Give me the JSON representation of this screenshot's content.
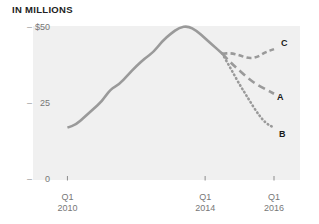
{
  "chart_data": {
    "type": "line",
    "title": "IN MILLIONS",
    "xlabel": "",
    "ylabel": "",
    "ylim": [
      0,
      50
    ],
    "yticks": [
      0,
      25,
      50
    ],
    "ytick_labels": [
      "0",
      "25",
      "$50"
    ],
    "xtick_labels": [
      {
        "quarter": "Q1",
        "year": "2010"
      },
      {
        "quarter": "Q1",
        "year": "2014"
      },
      {
        "quarter": "Q1",
        "year": "2016"
      }
    ],
    "xlim": [
      "Q1 2009",
      "Q1 2016"
    ],
    "grid": false,
    "legend_position": "inline-right",
    "line_color": "#9a9a9a",
    "series": [
      {
        "name": "historical",
        "label": "",
        "style": "solid",
        "points": [
          {
            "x": "Q1 2010",
            "y": 17.0
          },
          {
            "x": "Q2 2010",
            "y": 18.0
          },
          {
            "x": "Q3 2010",
            "y": 20.5
          },
          {
            "x": "Q4 2010",
            "y": 23.0
          },
          {
            "x": "Q1 2011",
            "y": 25.5
          },
          {
            "x": "Q2 2011",
            "y": 29.5
          },
          {
            "x": "Q3 2011",
            "y": 31.0
          },
          {
            "x": "Q4 2011",
            "y": 34.0
          },
          {
            "x": "Q1 2012",
            "y": 37.0
          },
          {
            "x": "Q2 2012",
            "y": 39.5
          },
          {
            "x": "Q3 2012",
            "y": 41.5
          },
          {
            "x": "Q4 2012",
            "y": 45.0
          },
          {
            "x": "Q1 2013",
            "y": 47.5
          },
          {
            "x": "Q2 2013",
            "y": 49.5
          },
          {
            "x": "Q3 2013",
            "y": 50.0
          },
          {
            "x": "Q4 2013",
            "y": 48.5
          },
          {
            "x": "Q1 2014",
            "y": 46.0
          },
          {
            "x": "Q2 2014",
            "y": 43.5
          },
          {
            "x": "Q3 2014",
            "y": 41.0
          }
        ]
      },
      {
        "name": "scenario-c",
        "label": "C",
        "style": "dashed",
        "points": [
          {
            "x": "Q3 2014",
            "y": 41.0
          },
          {
            "x": "Q4 2014",
            "y": 41.2
          },
          {
            "x": "Q1 2015",
            "y": 40.5
          },
          {
            "x": "Q2 2015",
            "y": 39.5
          },
          {
            "x": "Q3 2015",
            "y": 39.8
          },
          {
            "x": "Q4 2015",
            "y": 41.5
          },
          {
            "x": "Q1 2016",
            "y": 42.5
          }
        ]
      },
      {
        "name": "scenario-a",
        "label": "A",
        "style": "long-dash",
        "points": [
          {
            "x": "Q3 2014",
            "y": 41.0
          },
          {
            "x": "Q4 2014",
            "y": 38.0
          },
          {
            "x": "Q1 2015",
            "y": 35.5
          },
          {
            "x": "Q2 2015",
            "y": 33.0
          },
          {
            "x": "Q3 2015",
            "y": 31.0
          },
          {
            "x": "Q4 2015",
            "y": 29.5
          },
          {
            "x": "Q1 2016",
            "y": 28.0
          }
        ]
      },
      {
        "name": "scenario-b",
        "label": "B",
        "style": "dotted",
        "points": [
          {
            "x": "Q3 2014",
            "y": 41.0
          },
          {
            "x": "Q4 2014",
            "y": 36.0
          },
          {
            "x": "Q1 2015",
            "y": 31.0
          },
          {
            "x": "Q2 2015",
            "y": 26.5
          },
          {
            "x": "Q3 2015",
            "y": 22.0
          },
          {
            "x": "Q4 2015",
            "y": 18.5
          },
          {
            "x": "Q1 2016",
            "y": 17.0
          }
        ]
      }
    ]
  }
}
